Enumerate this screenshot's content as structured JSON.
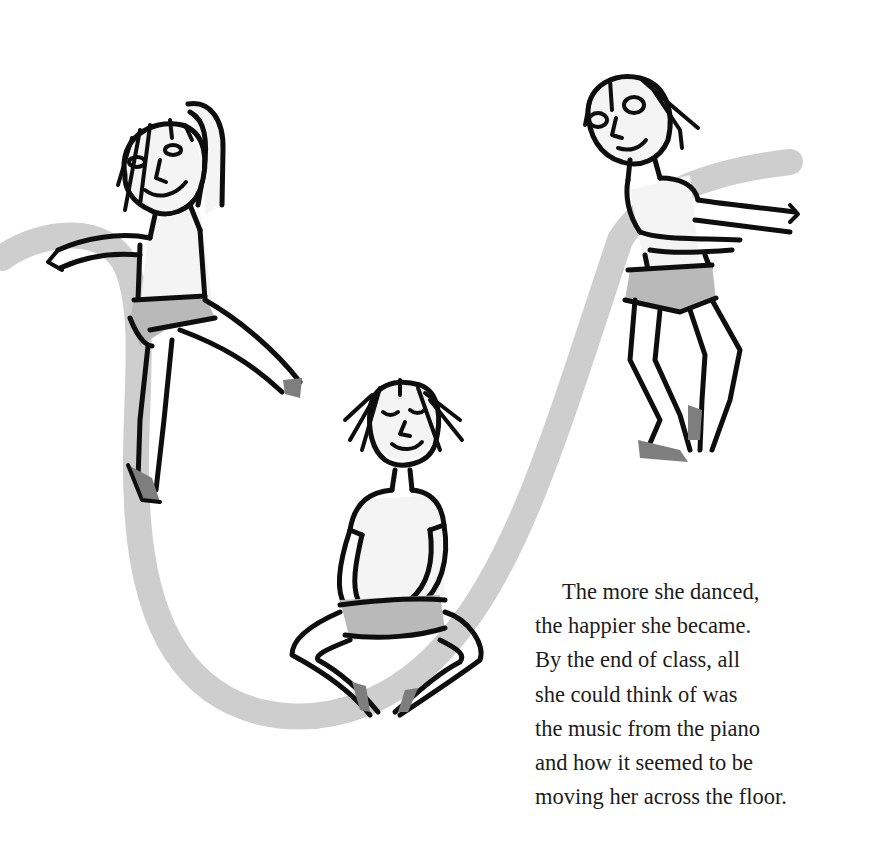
{
  "page": {
    "background": "#ffffff",
    "ink_color": "#0e0e0e",
    "swoosh_color": "#c8c8c8"
  },
  "illustration": {
    "figures": [
      {
        "name": "leaping-dancer",
        "pose": "arabesque with arm raised"
      },
      {
        "name": "seated-dancer",
        "pose": "cross-legged, eyes closed"
      },
      {
        "name": "standing-dancer",
        "pose": "arms extended, knees bent"
      }
    ],
    "motion_path": "gray brushstroke swoosh connecting dancers"
  },
  "story": {
    "lines": [
      "The more she danced,",
      "the happier she became.",
      "By the end of class, all",
      "she could think of was",
      "the music from the piano",
      "and how it seemed to be",
      "moving her across the floor."
    ]
  }
}
